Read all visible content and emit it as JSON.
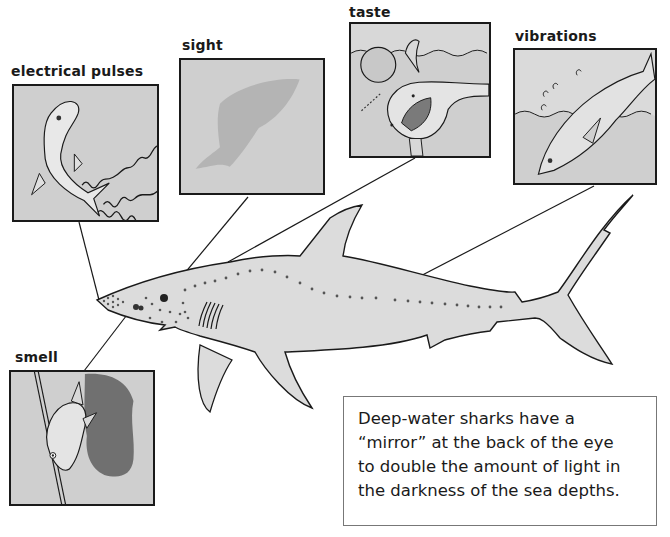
{
  "senses": [
    {
      "id": "electrical-pulses",
      "label": "electrical pulses"
    },
    {
      "id": "sight",
      "label": "sight"
    },
    {
      "id": "taste",
      "label": "taste"
    },
    {
      "id": "vibrations",
      "label": "vibrations"
    },
    {
      "id": "smell",
      "label": "smell"
    }
  ],
  "fact_box": {
    "lines": [
      "Deep-water sharks have a",
      "“mirror” at the back of the eye",
      "to double the amount of light in",
      "the darkness of the sea depths."
    ]
  },
  "colors": {
    "panel_bg": "#cfcfcf",
    "shark_fill": "#dcdcdc",
    "outline": "#1a1a1a",
    "dark_cloud": "#5a5a5a"
  }
}
